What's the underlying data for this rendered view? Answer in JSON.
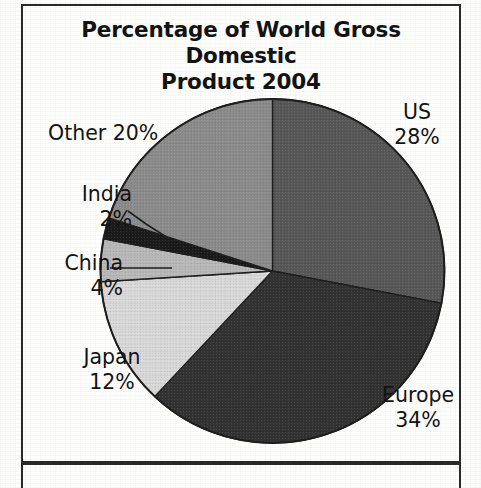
{
  "title": {
    "line1": "Percentage of World Gross Domestic",
    "line2": "Product  2004"
  },
  "chart_data": {
    "type": "pie",
    "title": "Percentage of World Gross Domestic Product  2004",
    "unit": "percent",
    "start_angle_deg": 0,
    "direction": "clockwise",
    "legend": "none-labels-outside",
    "grid": false,
    "categories": [
      "US",
      "Europe",
      "Japan",
      "China",
      "India",
      "Other"
    ],
    "values": [
      28,
      34,
      12,
      4,
      2,
      20
    ],
    "labels": [
      "US 28%",
      "Europe 34%",
      "Japan 12%",
      "China 4%",
      "India 2%",
      "Other 20%"
    ],
    "colors": [
      "#585858",
      "#333333",
      "#d9d9d9",
      "#b9b9b9",
      "#1b1b1b",
      "#8c8c8c"
    ],
    "slices": [
      {
        "name": "US",
        "value": 28,
        "label_name": "US",
        "label_pct": "28%",
        "color": "#585858",
        "start_deg": 0,
        "end_deg": 100.8,
        "leader": false
      },
      {
        "name": "Europe",
        "value": 34,
        "label_name": "Europe",
        "label_pct": "34%",
        "color": "#333333",
        "start_deg": 100.8,
        "end_deg": 223.2,
        "leader": false
      },
      {
        "name": "Japan",
        "value": 12,
        "label_name": "Japan",
        "label_pct": "12%",
        "color": "#d9d9d9",
        "start_deg": 223.2,
        "end_deg": 266.4,
        "leader": false
      },
      {
        "name": "China",
        "value": 4,
        "label_name": "China",
        "label_pct": "4%",
        "color": "#b9b9b9",
        "start_deg": 266.4,
        "end_deg": 280.8,
        "leader": true
      },
      {
        "name": "India",
        "value": 2,
        "label_name": "India",
        "label_pct": "2%",
        "color": "#1b1b1b",
        "start_deg": 280.8,
        "end_deg": 288.0,
        "leader": true
      },
      {
        "name": "Other",
        "value": 20,
        "label_name": "Other",
        "label_pct": "20%",
        "color": "#8c8c8c",
        "start_deg": 288.0,
        "end_deg": 360.0,
        "leader": false
      }
    ]
  },
  "labels": {
    "us": {
      "name": "US",
      "pct": "28%"
    },
    "europe": {
      "name": "Europe",
      "pct": "34%"
    },
    "japan": {
      "name": "Japan",
      "pct": "12%"
    },
    "china": {
      "name": "China",
      "pct": "4%"
    },
    "india": {
      "name": "India",
      "pct": "2%"
    },
    "other": {
      "name": "Other 20%",
      "pct": ""
    }
  },
  "colors": {
    "outline": "#2a2a2a",
    "text": "#131313",
    "background": "#fdfdfc"
  }
}
